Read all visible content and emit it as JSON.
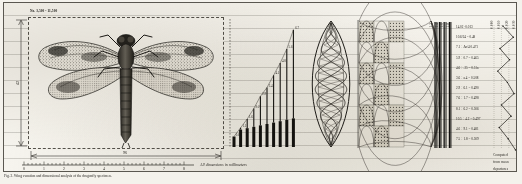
{
  "plate": {
    "caption": "Fig. 2.  Wing venation and dimensional analysis of the dragonfly specimen.",
    "units_note": "All dimensions in millimeters",
    "top_left_note_line1": "No. 3,500 - 11,500",
    "top_left_note_line2": "Scale 0.08 = 1 cm  Plate IV",
    "corner_note_line1": "Computed",
    "corner_note_line2": "from mean",
    "corner_note_line3": "departures"
  },
  "specimen": {
    "name": "dragonfly-specimen-drawing",
    "label_width": "96",
    "label_height": "42"
  },
  "ruler": {
    "ticks": [
      "0",
      "1",
      "2",
      "3",
      "4",
      "5",
      "6",
      "7",
      "8"
    ]
  },
  "chart_data": [
    {
      "type": "bar",
      "name": "ascending-step-chart",
      "title": "",
      "xlabel": "",
      "ylabel": "",
      "categories": [
        "1",
        "2",
        "3",
        "4",
        "5",
        "6",
        "7",
        "8",
        "9",
        "10"
      ],
      "values": [
        0.6,
        1.1,
        1.6,
        2.2,
        2.9,
        3.4,
        4.1,
        4.8,
        5.6,
        6.7
      ],
      "data_labels": [
        "0.6",
        "1.1",
        "1.6",
        "2.2",
        "2.9",
        "3.4",
        "4.1",
        "4.8",
        "5.6",
        "6.7"
      ],
      "ylim": [
        0,
        7.2
      ],
      "grid": true,
      "legend": "none"
    },
    {
      "type": "line",
      "name": "deviation-zigzag-plot",
      "title": "",
      "xlabel": "",
      "ylabel": "",
      "x_tick_labels": [
        "0.000",
        "0.010",
        "0.020",
        "0.030"
      ],
      "y": [
        0.012,
        0.026,
        0.008,
        0.021,
        0.005,
        0.018,
        0.027,
        0.01,
        0.023,
        0.007,
        0.019,
        0.029
      ],
      "xlim": [
        0.0,
        0.035
      ],
      "grid": true,
      "legend": "none"
    }
  ],
  "bundle_labels": [
    "1.2",
    "1.4",
    "1.6",
    "1.8"
  ],
  "data_table": {
    "rows": [
      "14.02   ·0.013",
      "10.6/24 = 0.48",
      "7.1 ÷ Δo/4  0.471",
      "5.9 ÷ 0.7 = 0.465",
      "4.6 ÷ .25 = 0.51a",
      "3.6 ÷ a.4  = 0.508",
      "2.9 ÷ 6.1  = 0.490",
      "7.6 ÷ 1.7  = 0.498",
      "8.1 ÷ 6.2  = 0.506",
      "10.5 ÷ 4.2 = 0.497",
      "4.6 ÷ 9.1 = 0.481",
      "7.5 ÷ 1.8 = 0.509"
    ]
  },
  "colors": {
    "paper": "#f6f4ee",
    "ink": "#24221e",
    "rule": "#78766e",
    "border": "#5a5750"
  }
}
